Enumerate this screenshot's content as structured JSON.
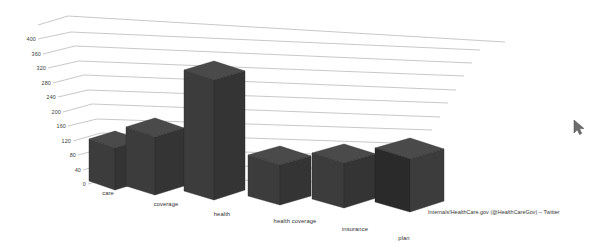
{
  "chart_data": {
    "type": "bar",
    "title": "",
    "subtitle": "",
    "xlabel": "",
    "ylabel": "",
    "categories": [
      "care",
      "coverage",
      "health",
      "health coverage",
      "insurance",
      "plan"
    ],
    "values": [
      120,
      160,
      345,
      75,
      85,
      105
    ],
    "ylim": [
      0,
      400
    ],
    "ytick_step": 40,
    "ytick_labels": [
      "400",
      "360",
      "320",
      "280",
      "240",
      "200",
      "160",
      "120",
      "80",
      "40",
      "0"
    ],
    "ytick_values": [
      400,
      360,
      320,
      280,
      240,
      200,
      160,
      120,
      80,
      40,
      0
    ],
    "grid": true,
    "grid_orientation": "horizontal-3d-perspective",
    "legend": "none",
    "legend_position": "none",
    "three_d": true,
    "bar_face_color": "#3a3a3a",
    "bar_top_color": "#454545",
    "bar_side_color": "#1e1e1e",
    "gridline_color": "#9a9a9a",
    "background_color": "#ffffff",
    "annotations": [
      {
        "name": "source-caption",
        "text": "Internals!HealthCare.gov (@HealthCareGov) – Twitter"
      }
    ]
  },
  "cursor": {
    "name": "mouse-pointer",
    "x": 578,
    "y": 126
  }
}
